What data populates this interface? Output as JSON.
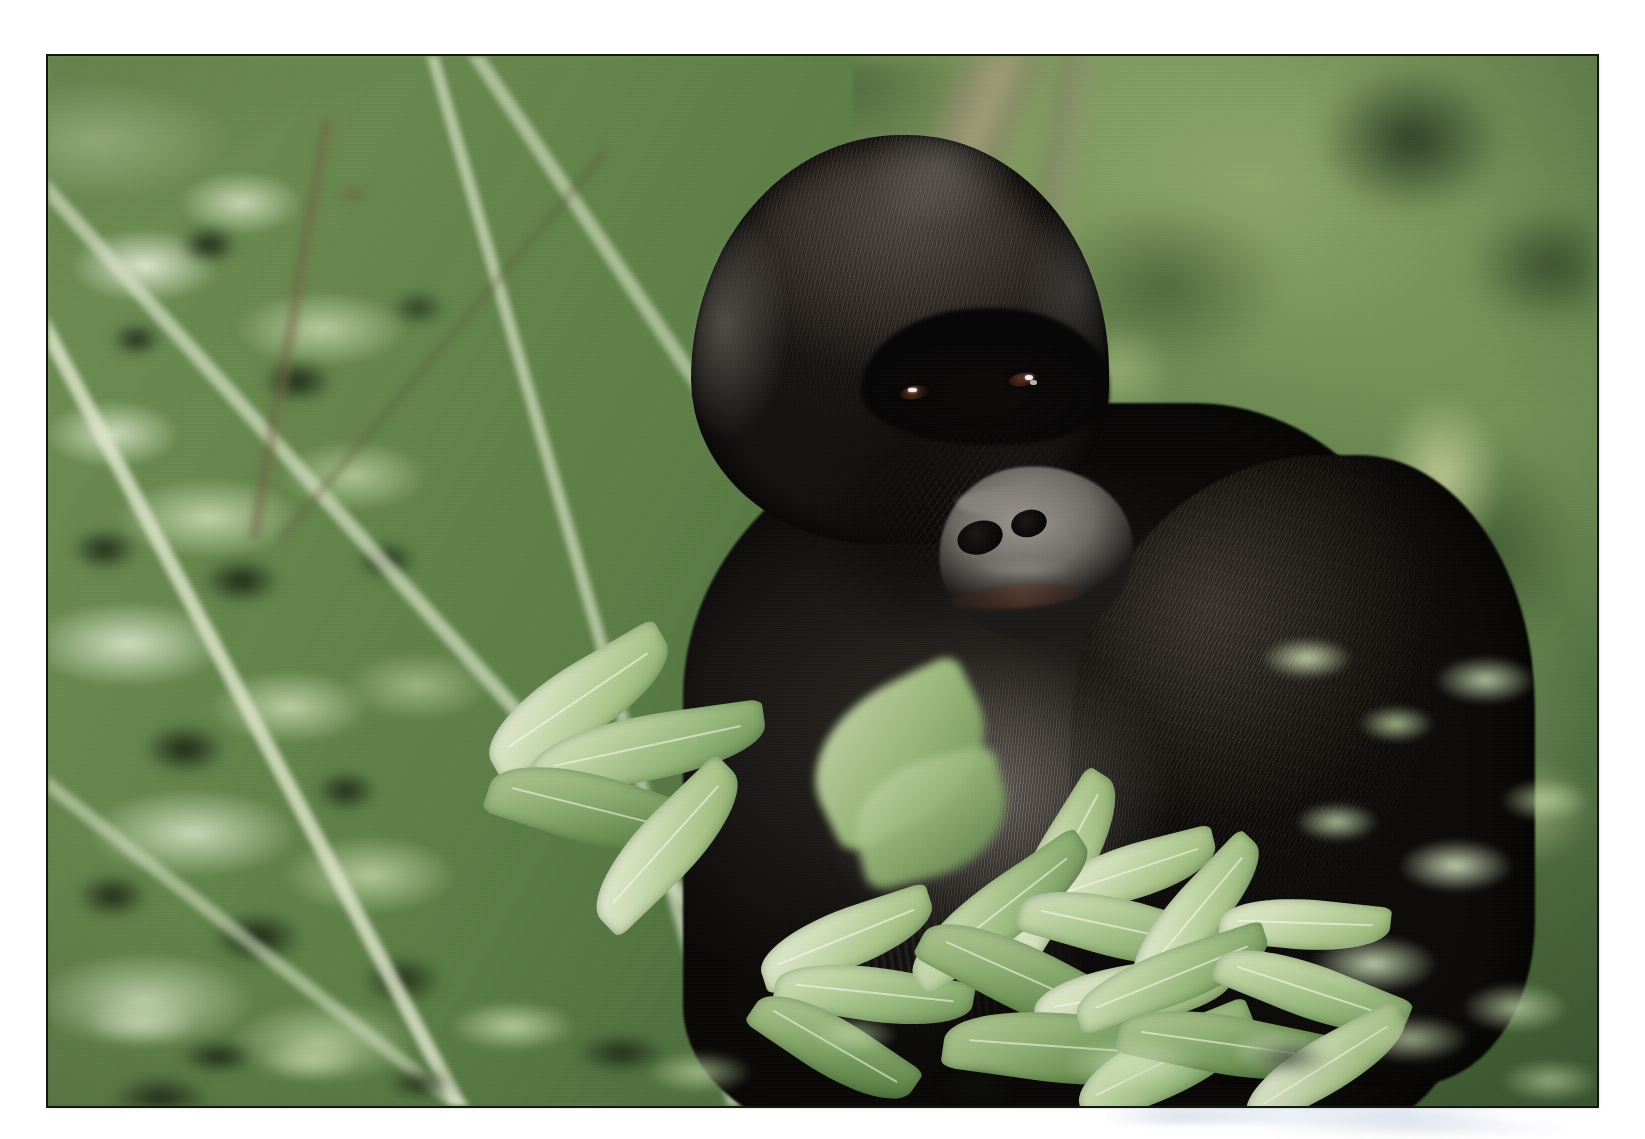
{
  "page": {
    "background_color": "#ffffff",
    "width": 1645,
    "height": 1139
  },
  "photograph": {
    "subject": "Mountain gorilla silverback",
    "setting": "Dense green montane forest vegetation",
    "orientation": "landscape",
    "border_color": "#15160f",
    "frame": {
      "left": 48,
      "top": 56,
      "width": 1549,
      "height": 1050
    },
    "caption": "",
    "elements": {
      "head_label": "gorilla-head",
      "face_label": "gorilla-face",
      "muzzle_label": "gorilla-muzzle",
      "eye_left_label": "gorilla-left-eye",
      "eye_right_label": "gorilla-right-eye",
      "torso_label": "gorilla-torso",
      "arm_label": "gorilla-right-arm",
      "chest_label": "gorilla-silver-chest",
      "foliage_left_label": "left-foliage-bush",
      "foliage_foreground_label": "foreground-leaves",
      "background_label": "blurred-forest-background",
      "branch_label": "background-branch"
    },
    "palette": {
      "background_green_light": "#7e9c60",
      "background_green_mid": "#5d7d48",
      "background_green_dark": "#3f5c33",
      "foliage_pale": "#dfe8cd",
      "foliage_mid": "#93b678",
      "foliage_shadow": "#0e160a",
      "fur_black": "#0a0908",
      "fur_brown_black": "#2c2723",
      "fur_highlight": "#a8a69c",
      "muzzle_gray": "#9e9a94",
      "nostril_black": "#060505",
      "eye_iris_brown": "#5b2f22",
      "eye_catchlight": "#f2efe8",
      "branch_tan": "#b0a086",
      "scanner_ghost_blue": "#c4d1e1"
    }
  }
}
